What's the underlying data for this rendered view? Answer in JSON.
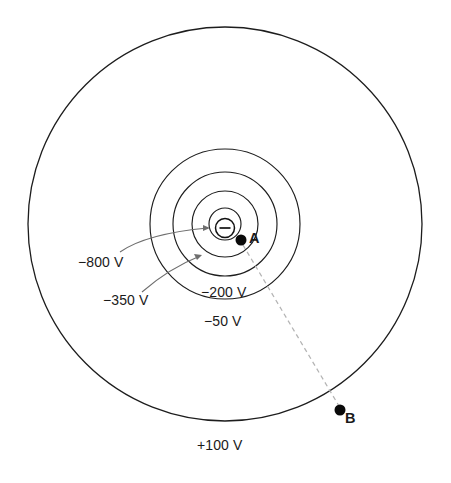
{
  "figure": {
    "kind": "equipotential-field-diagram",
    "background_color": "#ffffff",
    "line_color": "#1d1d1d",
    "leader_color": "#6e6e6e",
    "dashed_color": "#b4b4b4",
    "marker_color": "#0a0a0a",
    "center": {
      "x": 225,
      "y": 224
    },
    "charge": {
      "symbol_name": "negative-charge-icon",
      "symbol": "⊖",
      "sign": "−",
      "radius": 10
    },
    "equipotentials": [
      {
        "id": "v-800",
        "label": "−800 V",
        "value": -800,
        "unit": "V",
        "radius": 16,
        "has_leader": true
      },
      {
        "id": "v-350",
        "label": "−350 V",
        "value": -350,
        "unit": "V",
        "radius": 33,
        "has_leader": true
      },
      {
        "id": "v-200",
        "label": "−200 V",
        "value": -200,
        "unit": "V",
        "radius": 52,
        "has_leader": false
      },
      {
        "id": "v-50",
        "label": "−50 V",
        "value": -50,
        "unit": "V",
        "radius": 75,
        "has_leader": false
      },
      {
        "id": "v100",
        "label": "+100 V",
        "value": 100,
        "unit": "V",
        "radius": 197,
        "has_leader": false
      }
    ],
    "points": [
      {
        "id": "point-a",
        "label": "A",
        "x": 241,
        "y": 240
      },
      {
        "id": "point-b",
        "label": "B",
        "x": 340,
        "y": 410
      }
    ],
    "connector": {
      "name": "path-a-to-b",
      "from": "A",
      "to": "B",
      "style": "dashed"
    }
  }
}
